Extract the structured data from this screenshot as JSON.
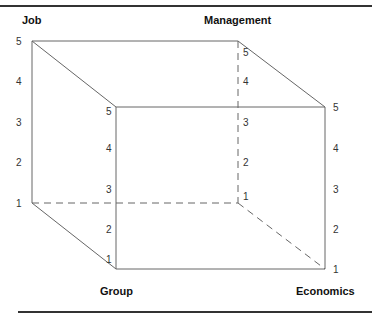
{
  "diagram": {
    "type": "3d-cube-framework",
    "axes": {
      "job": {
        "label": "Job",
        "ticks": [
          "5",
          "4",
          "3",
          "2",
          "1"
        ]
      },
      "management": {
        "label": "Management",
        "ticks": [
          "5",
          "4",
          "3",
          "2",
          "1"
        ]
      },
      "group": {
        "label": "Group",
        "ticks": [
          "5",
          "4",
          "3",
          "2",
          "1"
        ]
      },
      "economics": {
        "label": "Economics",
        "ticks": [
          "5",
          "4",
          "3",
          "2",
          "1"
        ]
      }
    },
    "colors": {
      "edge": "#555555",
      "text": "#222222",
      "rule": "#333333"
    }
  }
}
